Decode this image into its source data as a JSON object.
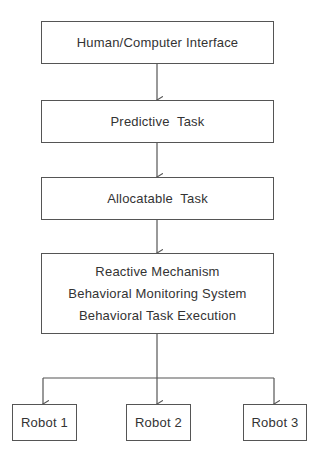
{
  "diagram": {
    "nodes": {
      "hci": {
        "label": "Human/Computer Interface"
      },
      "predictive": {
        "label": "Predictive  Task"
      },
      "allocatable": {
        "label": "Allocatable  Task"
      },
      "behavior": {
        "lines": [
          "Reactive Mechanism",
          "Behavioral Monitoring System",
          "Behavioral Task Execution"
        ]
      },
      "robots": [
        {
          "label": "Robot 1"
        },
        {
          "label": "Robot 2"
        },
        {
          "label": "Robot 3"
        }
      ]
    },
    "edges": [
      [
        "hci",
        "predictive"
      ],
      [
        "predictive",
        "allocatable"
      ],
      [
        "allocatable",
        "behavior"
      ],
      [
        "behavior",
        "robot1"
      ],
      [
        "behavior",
        "robot2"
      ],
      [
        "behavior",
        "robot3"
      ]
    ]
  }
}
